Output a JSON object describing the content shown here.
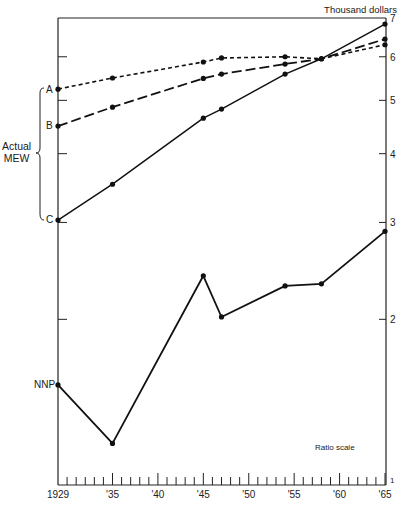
{
  "chart_data": {
    "type": "line",
    "title": "",
    "ylabel": "Thousand dollars",
    "xlabel": "",
    "yscale": "log",
    "scale_note": "Ratio scale",
    "ylim": [
      1,
      7
    ],
    "xlim": [
      1929,
      1965
    ],
    "y_ticks": [
      1,
      2,
      3,
      4,
      5,
      6,
      7
    ],
    "x_tick_labels": [
      "1929",
      "'35",
      "'40",
      "'45",
      "'50",
      "'55",
      "'60",
      "'65"
    ],
    "x_tick_years": [
      1929,
      1935,
      1940,
      1945,
      1950,
      1955,
      1960,
      1965
    ],
    "bracket_label": [
      "Actual",
      "MEW"
    ],
    "series": [
      {
        "name": "A",
        "style": "short-dash",
        "x": [
          1929,
          1935,
          1945,
          1947,
          1954,
          1958,
          1965
        ],
        "values": [
          5.24,
          5.49,
          5.87,
          5.97,
          6.0,
          5.95,
          6.31
        ]
      },
      {
        "name": "B",
        "style": "long-dash",
        "x": [
          1929,
          1935,
          1945,
          1947,
          1954,
          1958,
          1965
        ],
        "values": [
          4.49,
          4.86,
          5.48,
          5.58,
          5.82,
          5.95,
          6.46
        ]
      },
      {
        "name": "C",
        "style": "solid",
        "x": [
          1929,
          1935,
          1945,
          1947,
          1954,
          1958,
          1965
        ],
        "values": [
          3.03,
          3.52,
          4.64,
          4.82,
          5.58,
          5.95,
          6.88
        ]
      },
      {
        "name": "NNP",
        "style": "solid",
        "x": [
          1929,
          1935,
          1945,
          1947,
          1954,
          1958,
          1965
        ],
        "values": [
          1.52,
          1.19,
          2.4,
          2.02,
          2.3,
          2.32,
          2.89
        ]
      }
    ]
  },
  "labels": {
    "unit": "Thousand dollars",
    "ratio": "Ratio scale",
    "actual": "Actual",
    "mew": "MEW",
    "A": "A",
    "B": "B",
    "C": "C",
    "NNP": "NNP"
  }
}
